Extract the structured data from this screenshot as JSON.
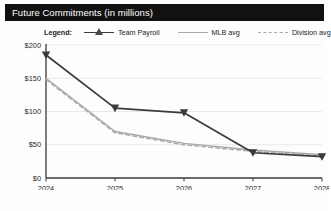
{
  "header": {
    "title": "Future Commitments (in millions)",
    "bar_color": "#111111",
    "text_color": "#ffffff"
  },
  "legend": {
    "title": "Legend:",
    "position": "top",
    "entries": [
      {
        "label": "Team Payroll",
        "marker": "triangle",
        "line": "solid",
        "color": "#3b3b3b"
      },
      {
        "label": "MLB avg",
        "marker": "none",
        "line": "solid",
        "color": "#a9a9a9"
      },
      {
        "label": "Division avg",
        "marker": "none",
        "line": "dashed",
        "color": "#a9a9a9"
      }
    ]
  },
  "chart_data": {
    "type": "line",
    "title": "Future Commitments (in millions)",
    "xlabel": "",
    "ylabel": "",
    "x": [
      "2024",
      "2025",
      "2026",
      "2027",
      "2028"
    ],
    "categories": [
      "2024",
      "2025",
      "2026",
      "2027",
      "2028"
    ],
    "ylim": [
      0,
      200
    ],
    "ytick_labels": [
      "$0",
      "$50",
      "$100",
      "$150",
      "$200"
    ],
    "ytick_values": [
      0,
      50,
      100,
      150,
      200
    ],
    "xtick_labels": [
      "2024",
      "2025",
      "2026",
      "2027",
      "2028"
    ],
    "grid": true,
    "legend_position": "top",
    "series": [
      {
        "name": "Team Payroll",
        "color": "#3b3b3b",
        "line": "solid",
        "marker": "triangle",
        "values": [
          185,
          105,
          98,
          38,
          32
        ]
      },
      {
        "name": "MLB avg",
        "color": "#a9a9a9",
        "line": "solid",
        "marker": "none",
        "values": [
          150,
          70,
          52,
          42,
          35
        ]
      },
      {
        "name": "Division avg",
        "color": "#a9a9a9",
        "line": "dashed",
        "marker": "none",
        "values": [
          148,
          68,
          50,
          40,
          33
        ]
      }
    ]
  }
}
